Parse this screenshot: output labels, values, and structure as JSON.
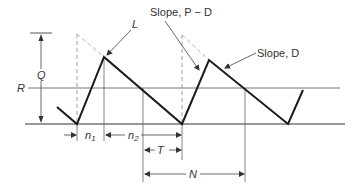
{
  "diagram": {
    "type": "inventory sawtooth (production/demand cycle)",
    "labels": {
      "Q": "Q",
      "R": "R",
      "L": "L",
      "slope_pd": "Slope, P − D",
      "slope_d": "Slope, D",
      "n1": "n",
      "n1_sub": "1",
      "n2": "n",
      "n2_sub": "2",
      "T": "T",
      "N": "N"
    },
    "colors": {
      "line": "#1a1a1a",
      "thin": "#555555",
      "dashed": "#888888",
      "text": "#333333"
    }
  }
}
